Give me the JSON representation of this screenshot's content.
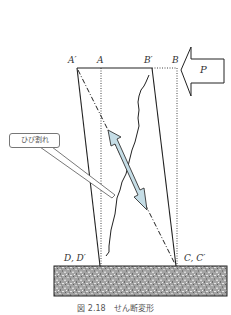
{
  "figure": {
    "caption": "図 2.18　せん断変形",
    "points": {
      "a_prime": "A′",
      "a": "A",
      "b_prime": "B′",
      "b": "B",
      "d_d_prime": "D, D′",
      "c_c_prime": "C, C′"
    },
    "force_label": "P",
    "callout_label": "ひび割れ",
    "colors": {
      "line": "#222222",
      "arrow_fill": "#c5dde6",
      "ground_base": "#9a9a9a",
      "callout_border": "#777777"
    }
  }
}
